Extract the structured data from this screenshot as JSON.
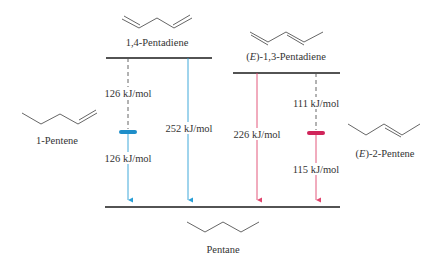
{
  "colors": {
    "blue": "#2a9fd6",
    "blue_bar": "#1e8ec9",
    "red": "#e0456d",
    "red_bar": "#d0245a",
    "level": "#1a1a1a",
    "dash": "#555555",
    "text": "#333333"
  },
  "molecules": {
    "pentadiene_14": {
      "name": "1,4-Pentadiene"
    },
    "pentadiene_13": {
      "prefix": "(",
      "stereo": "E",
      "suffix": ")-1,3-Pentadiene"
    },
    "pentene_1": {
      "name": "1-Pentene"
    },
    "pentene_2": {
      "prefix": "(",
      "stereo": "E",
      "suffix": ")-2-Pentene"
    },
    "pentane": {
      "name": "Pentane"
    }
  },
  "energies": {
    "step1_14": "126 kJ/mol",
    "step2_14": "126 kJ/mol",
    "total_14": "252 kJ/mol",
    "total_13": "226 kJ/mol",
    "step1_13": "111 kJ/mol",
    "step2_13": "115 kJ/mol"
  }
}
